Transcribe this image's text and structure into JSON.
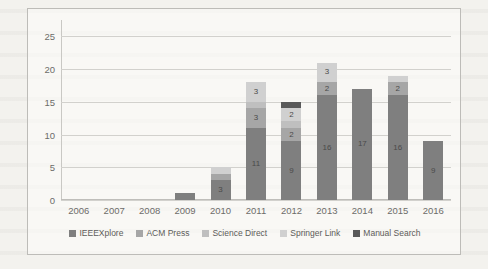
{
  "chart_data": {
    "type": "bar",
    "stacked": true,
    "title": "",
    "xlabel": "",
    "ylabel": "",
    "ylim": [
      0,
      27.5
    ],
    "yticks": [
      "0",
      "5",
      "10",
      "15",
      "20",
      "25"
    ],
    "grid": true,
    "legend_position": "bottom",
    "categories": [
      "2006",
      "2007",
      "2008",
      "2009",
      "2010",
      "2011",
      "2012",
      "2013",
      "2014",
      "2015",
      "2016"
    ],
    "series": [
      {
        "name": "IEEEXplore",
        "color": "#7f7f7f",
        "values": [
          0,
          0,
          0,
          1,
          3,
          11,
          9,
          16,
          17,
          16,
          9
        ]
      },
      {
        "name": "ACM Press",
        "color": "#a6a6a6",
        "values": [
          0,
          0,
          0,
          0,
          1,
          3,
          2,
          2,
          0,
          2,
          0
        ]
      },
      {
        "name": "Science Direct",
        "color": "#bfbfbf",
        "values": [
          0,
          0,
          0,
          0,
          0,
          1,
          1,
          0,
          0,
          0,
          0
        ]
      },
      {
        "name": "Springer Link",
        "color": "#d0d0d0",
        "values": [
          0,
          0,
          0,
          0,
          1,
          3,
          2,
          3,
          0,
          1,
          0
        ]
      },
      {
        "name": "Manual Search",
        "color": "#595959",
        "values": [
          0,
          0,
          0,
          0,
          0,
          0,
          1,
          0,
          0,
          0,
          0
        ]
      }
    ],
    "totals": [
      0,
      0,
      0,
      1,
      5,
      18,
      15,
      21,
      17,
      19,
      9
    ],
    "bar_labels": {
      "2009": [
        "1"
      ],
      "2010": [
        "3",
        "1",
        "1"
      ],
      "2011": [
        "11",
        "3",
        "1",
        "3"
      ],
      "2012": [
        "9",
        "2",
        "1",
        "2",
        "1"
      ],
      "2013": [
        "16",
        "2",
        "3"
      ],
      "2014": [
        "17"
      ],
      "2015": [
        "16",
        "2",
        "1"
      ],
      "2016": [
        "9"
      ]
    }
  },
  "legend": {
    "items": [
      {
        "label": "IEEEXplore"
      },
      {
        "label": "ACM Press"
      },
      {
        "label": "Science Direct"
      },
      {
        "label": "Springer Link"
      },
      {
        "label": "Manual Search"
      }
    ]
  }
}
